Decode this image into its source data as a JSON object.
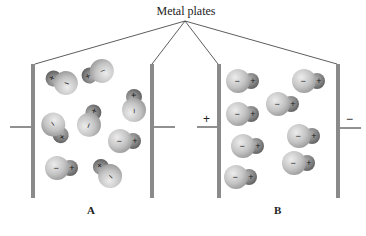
{
  "title": "Metal plates",
  "panels": [
    {
      "label": "A",
      "left_terminal_sign": "",
      "right_terminal_sign": "",
      "field": "none",
      "molecules": [
        {
          "x": 63,
          "y": 82,
          "angle": 200
        },
        {
          "x": 99,
          "y": 72,
          "angle": 160
        },
        {
          "x": 134,
          "y": 107,
          "angle": 270
        },
        {
          "x": 55,
          "y": 127,
          "angle": 55
        },
        {
          "x": 90,
          "y": 122,
          "angle": 290
        },
        {
          "x": 123,
          "y": 141,
          "angle": 0
        },
        {
          "x": 60,
          "y": 168,
          "angle": 0
        },
        {
          "x": 108,
          "y": 174,
          "angle": 225
        }
      ]
    },
    {
      "label": "B",
      "left_terminal_sign": "+",
      "right_terminal_sign": "−",
      "field": "aligned",
      "molecules": [
        {
          "x": 241,
          "y": 81,
          "angle": 0
        },
        {
          "x": 307,
          "y": 81,
          "angle": 0
        },
        {
          "x": 281,
          "y": 104,
          "angle": 0
        },
        {
          "x": 241,
          "y": 114,
          "angle": 0
        },
        {
          "x": 302,
          "y": 136,
          "angle": 0
        },
        {
          "x": 246,
          "y": 146,
          "angle": 0
        },
        {
          "x": 297,
          "y": 163,
          "angle": 0
        },
        {
          "x": 239,
          "y": 177,
          "angle": 0
        }
      ]
    }
  ],
  "molecule_glyphs": {
    "negative": "−",
    "positive": "+"
  },
  "colors": {
    "plate": "#8a8a8a",
    "negative_atom": "#c9c9c9",
    "positive_atom": "#8c8c8c",
    "line": "#333333"
  }
}
